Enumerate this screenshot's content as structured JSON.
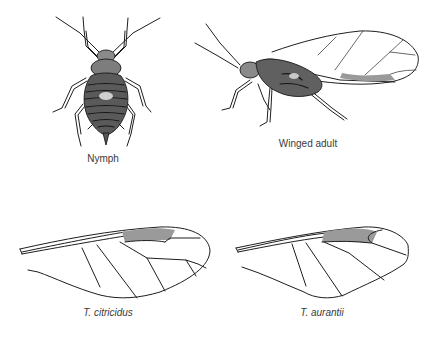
{
  "figure": {
    "panels": [
      {
        "id": "nymph",
        "caption": "Nymph",
        "caption_style": "regular"
      },
      {
        "id": "winged-adult",
        "caption": "Winged adult",
        "caption_style": "regular"
      },
      {
        "id": "wing-t-citricidus",
        "caption": "T. citricidus",
        "caption_style": "italic"
      },
      {
        "id": "wing-t-aurantii",
        "caption": "T. aurantii",
        "caption_style": "italic"
      }
    ]
  },
  "colors": {
    "background": "#ffffff",
    "ink": "#1e1e1e",
    "caption": "#3a3a3a"
  }
}
